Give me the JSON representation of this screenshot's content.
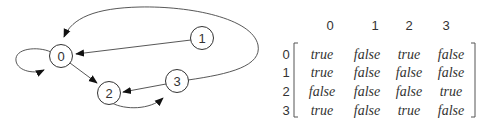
{
  "graph": {
    "nodes": [
      {
        "id": "0",
        "label": "0",
        "x": 61,
        "y": 56
      },
      {
        "id": "1",
        "label": "1",
        "x": 202,
        "y": 38
      },
      {
        "id": "2",
        "label": "2",
        "x": 109,
        "y": 93
      },
      {
        "id": "3",
        "label": "3",
        "x": 177,
        "y": 81
      }
    ],
    "edges": [
      {
        "from": "0",
        "to": "0"
      },
      {
        "from": "0",
        "to": "2"
      },
      {
        "from": "1",
        "to": "0"
      },
      {
        "from": "2",
        "to": "3"
      },
      {
        "from": "3",
        "to": "0"
      },
      {
        "from": "3",
        "to": "2"
      }
    ]
  },
  "matrix": {
    "col_headers": [
      "0",
      "1",
      "2",
      "3"
    ],
    "row_headers": [
      "0",
      "1",
      "2",
      "3"
    ],
    "rows": [
      [
        "true",
        "false",
        "true",
        "false"
      ],
      [
        "true",
        "false",
        "false",
        "false"
      ],
      [
        "false",
        "false",
        "false",
        "true"
      ],
      [
        "true",
        "false",
        "true",
        "false"
      ]
    ]
  }
}
